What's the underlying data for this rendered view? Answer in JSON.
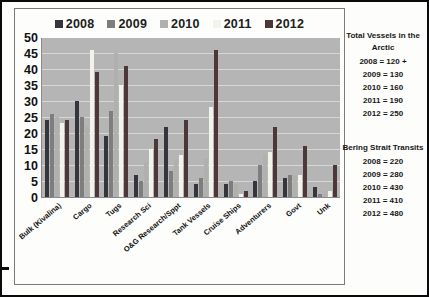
{
  "chart_data": {
    "type": "bar",
    "title": "",
    "categories": [
      "Bulk (Kivalina)",
      "Cargo",
      "Tugs",
      "Research Sci",
      "O&G Research/Sppt",
      "Tank Vessels",
      "Cruise Ships",
      "Adventurers",
      "Govt",
      "Unk"
    ],
    "series": [
      {
        "name": "2008",
        "color": "#35353e",
        "values": [
          24,
          30,
          19,
          7,
          22,
          4,
          4,
          5,
          6,
          3
        ]
      },
      {
        "name": "2009",
        "color": "#7e7e7e",
        "values": [
          26,
          25,
          27,
          5,
          8,
          6,
          5,
          10,
          7,
          1
        ]
      },
      {
        "name": "2010",
        "color": "#b0b0af",
        "values": [
          25,
          22,
          45,
          11,
          12,
          12,
          4,
          13,
          7,
          2
        ]
      },
      {
        "name": "2011",
        "color": "#f3f3ec",
        "values": [
          23,
          46,
          35,
          15,
          13,
          28,
          1,
          14,
          7,
          2
        ]
      },
      {
        "name": "2012",
        "color": "#4c3838",
        "values": [
          24,
          39,
          41,
          18,
          24,
          46,
          2,
          22,
          16,
          10
        ]
      }
    ],
    "xlabel": "",
    "ylabel": "",
    "ylim": [
      0,
      50
    ],
    "ytick_step": 5,
    "grid": true,
    "legend_position": "top",
    "plot_background": "#b5b5b5",
    "gridline_color": "#d6d6d6"
  },
  "side_panel": {
    "blocks": [
      {
        "title": "Total Vessels in the Arctic",
        "lines": [
          "2008 = 120 +",
          "2009 = 130",
          "2010 = 160",
          "2011 = 190",
          "2012 = 250"
        ]
      },
      {
        "title": "Bering Strait Transits",
        "lines": [
          "2008 = 220",
          "2009 = 280",
          "2010 = 430",
          "2011 = 410",
          "2012 = 480"
        ]
      }
    ]
  }
}
